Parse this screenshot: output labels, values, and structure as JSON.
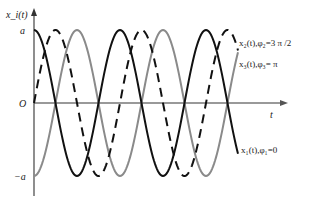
{
  "chart_data": {
    "type": "line",
    "title": "",
    "xlabel": "t",
    "ylabel": "x_i(t)",
    "y_ticks": [
      "a",
      "O",
      "−a"
    ],
    "ylim": [
      -1,
      1
    ],
    "xlim_periods": [
      0,
      2.35
    ],
    "grid": false,
    "series": [
      {
        "name": "x₁(t), φ₁=0",
        "phase": 0,
        "style": "solid",
        "color": "#111111"
      },
      {
        "name": "x₂(t), φ₂=3 π /2",
        "phase": 4.712389,
        "style": "dashed",
        "color": "#111111"
      },
      {
        "name": "x₃(t), φ₃= π",
        "phase": 3.141593,
        "style": "solid",
        "color": "#8a8a8a"
      }
    ]
  },
  "labels": {
    "y_axis": "x_i(t)",
    "x_axis": "t",
    "tick_a": "a",
    "tick_origin": "O",
    "tick_neg_a": "−a",
    "legend_x2": "x₂(t),φ₂=3 π /2",
    "legend_x3": "x₃(t),φ₃= π",
    "legend_x1": "x₁(t),φ₁=0"
  }
}
